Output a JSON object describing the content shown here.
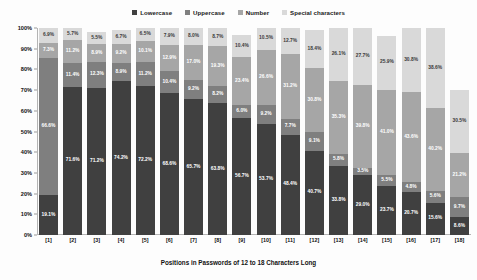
{
  "chart_data": {
    "type": "bar",
    "subtype": "stacked-percent",
    "title": "",
    "xlabel": "Positions in Passwords of 12 to 18 Characters Long",
    "ylabel": "Percentage of Character Types",
    "ylim": [
      0,
      100
    ],
    "ytick_labels": [
      "0%",
      "10%",
      "20%",
      "30%",
      "40%",
      "50%",
      "60%",
      "70%",
      "80%",
      "90%",
      "100%"
    ],
    "ytick_values": [
      0,
      10,
      20,
      30,
      40,
      50,
      60,
      70,
      80,
      90,
      100
    ],
    "grid": false,
    "legend_position": "top-center",
    "categories": [
      "[1]",
      "[2]",
      "[3]",
      "[4]",
      "[5]",
      "[6]",
      "[7]",
      "[8]",
      "[9]",
      "[10]",
      "[11]",
      "[12]",
      "[13]",
      "[14]",
      "[15]",
      "[16]",
      "[17]",
      "[18]"
    ],
    "series": [
      {
        "name": "Lowercase",
        "color": "#404040",
        "values": [
          19.1,
          71.6,
          71.2,
          74.2,
          72.2,
          68.6,
          65.7,
          63.8,
          56.7,
          53.7,
          48.4,
          40.7,
          33.8,
          29.0,
          23.7,
          20.7,
          15.6,
          8.6
        ]
      },
      {
        "name": "Uppercase",
        "color": "#7f7f7f",
        "values": [
          66.6,
          11.4,
          12.3,
          8.9,
          11.2,
          10.4,
          9.2,
          8.2,
          6.0,
          9.2,
          7.7,
          9.1,
          5.8,
          3.5,
          5.5,
          4.8,
          5.6,
          9.7
        ]
      },
      {
        "name": "Number",
        "color": "#a6a6a6",
        "values": [
          7.3,
          11.2,
          8.9,
          9.2,
          10.1,
          12.9,
          17.0,
          19.3,
          23.4,
          26.6,
          31.2,
          30.8,
          35.3,
          39.8,
          41.0,
          43.6,
          40.2,
          21.2
        ]
      },
      {
        "name": "Special characters",
        "color": "#d9d9d9",
        "values": [
          6.9,
          5.7,
          5.5,
          6.7,
          6.5,
          7.9,
          8.0,
          8.7,
          10.4,
          10.5,
          12.7,
          18.4,
          26.1,
          27.7,
          25.9,
          30.8,
          38.6,
          30.5
        ]
      }
    ],
    "data_labels": {
      "Lowercase": [
        "19.1%",
        "71.6%",
        "71.2%",
        "74.2%",
        "72.2%",
        "68.6%",
        "65.7%",
        "63.8%",
        "56.7%",
        "53.7%",
        "48.4%",
        "40.7%",
        "33.8%",
        "29.0%",
        "23.7%",
        "20.7%",
        "15.6%",
        "8.6%"
      ],
      "Uppercase": [
        "66.6%",
        "11.4%",
        "12.3%",
        "8.9%",
        "11.2%",
        "10.4%",
        "9.2%",
        "8.2%",
        "6.0%",
        "9.2%",
        "7.7%",
        "9.1%",
        "5.8%",
        "3.5%",
        "5.5%",
        "4.8%",
        "5.6%",
        "9.7%"
      ],
      "Number": [
        "7.3%",
        "11.2%",
        "8.9%",
        "9.2%",
        "10.1%",
        "12.9%",
        "17.0%",
        "19.3%",
        "23.4%",
        "26.6%",
        "31.2%",
        "30.8%",
        "35.3%",
        "39.8%",
        "41.0%",
        "43.6%",
        "40.2%",
        "21.2%"
      ],
      "Special characters": [
        "6.9%",
        "5.7%",
        "5.5%",
        "6.7%",
        "6.5%",
        "7.9%",
        "8.0%",
        "8.7%",
        "10.4%",
        "10.5%",
        "12.7%",
        "18.4%",
        "26.1%",
        "27.7%",
        "25.9%",
        "30.8%",
        "38.6%",
        "30.5%"
      ]
    }
  }
}
